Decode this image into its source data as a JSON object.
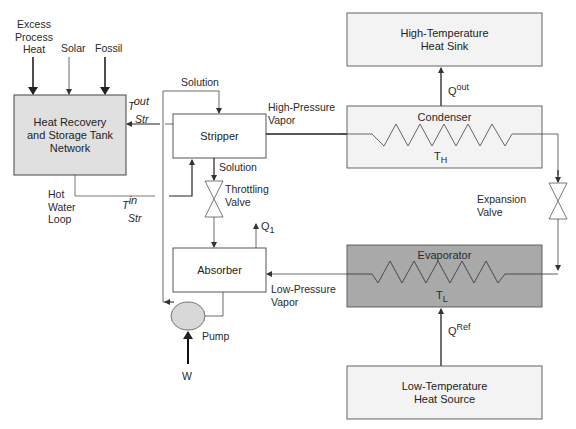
{
  "diagram": {
    "inputs": {
      "excess_process_heat": [
        "Excess",
        "Process",
        "Heat"
      ],
      "solar": "Solar",
      "fossil": "Fossil"
    },
    "blocks": {
      "heat_recovery": [
        "Heat Recovery",
        "and Storage Tank",
        "Network"
      ],
      "stripper": "Stripper",
      "absorber": "Absorber",
      "condenser": "Condenser",
      "evaporator": "Evaporator",
      "heat_sink": [
        "High-Temperature",
        "Heat Sink"
      ],
      "heat_source": [
        "Low-Temperature",
        "Heat Source"
      ],
      "pump": "Pump"
    },
    "labels": {
      "solution_top": "Solution",
      "solution_mid": "Solution",
      "throttling_valve": [
        "Throttling",
        "Valve"
      ],
      "expansion_valve": [
        "Expansion",
        "Valve"
      ],
      "high_pressure_vapor": [
        "High-Pressure",
        "Vapor"
      ],
      "low_pressure_vapor": [
        "Low-Pressure",
        "Vapor"
      ],
      "hot_water_loop": [
        "Hot",
        "Water",
        "Loop"
      ],
      "t_out": {
        "base": "T",
        "sup": "out",
        "sub": "Str"
      },
      "t_in": {
        "base": "T",
        "sup": "in",
        "sub": "Str"
      },
      "q_out": {
        "base": "Q",
        "sup": "out"
      },
      "q_ref": {
        "base": "Q",
        "sup": "Ref"
      },
      "q1": {
        "base": "Q",
        "sub": "1"
      },
      "th": {
        "base": "T",
        "sub": "H"
      },
      "tl": {
        "base": "T",
        "sub": "L"
      },
      "w": "W"
    },
    "colors": {
      "heat_recovery_fill": "#e0e0e0",
      "condenser_fill": "#f3f3f3",
      "evaporator_fill": "#a9a9a9",
      "sink_source_fill": "#f3f3f3",
      "pump_fill": "#d8d8d8",
      "line": "#333333"
    }
  }
}
